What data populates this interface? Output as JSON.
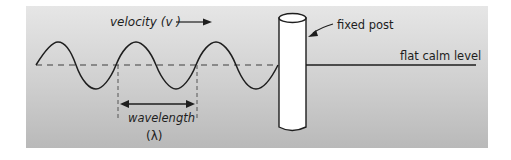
{
  "diagram": {
    "labels": {
      "velocity": "velocity (v )",
      "fixed_post": "fixed post",
      "flat_calm_level": "flat calm level",
      "wavelength": "wavelength",
      "lambda": "(λ)"
    },
    "colors": {
      "background_top": "#e6e6e6",
      "background_bottom": "#b9b9b9",
      "line": "#1e1e1e",
      "dashed_line": "#707070",
      "post_fill": "#ffffff"
    }
  }
}
